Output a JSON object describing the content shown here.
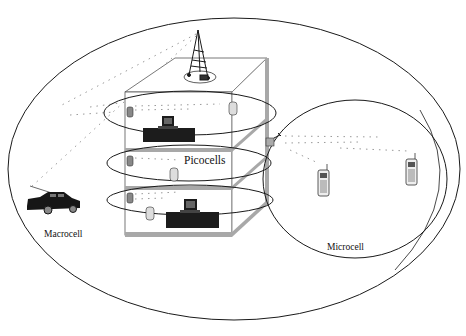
{
  "diagram": {
    "type": "cellular-network-hierarchy",
    "labels": {
      "picocells": "Picocells",
      "macrocell": "Macrocell",
      "microcell": "Microcell"
    },
    "regions": [
      {
        "name": "Macrocell",
        "shape": "ellipse",
        "contains": [
          "building",
          "car",
          "microcell"
        ]
      },
      {
        "name": "Microcell",
        "shape": "ellipse",
        "contains": [
          "mobile-phone",
          "mobile-phone"
        ]
      },
      {
        "name": "Picocells",
        "shape": "ellipse",
        "count": 3,
        "location": "building floors"
      }
    ],
    "elements": [
      {
        "name": "macrocell-tower",
        "icon": "antenna-tower-icon",
        "location": "building rooftop"
      },
      {
        "name": "microcell-base-station",
        "icon": "antenna-box-icon",
        "location": "building side"
      },
      {
        "name": "car",
        "icon": "car-icon",
        "location": "macrocell left"
      },
      {
        "name": "desktop-computers",
        "icon": "computer-icon",
        "count": 2
      },
      {
        "name": "handsets",
        "icon": "mobile-phone-icon",
        "count": 8
      }
    ],
    "colors": {
      "line": "#1a1a1a",
      "building_floor": "#a8a8a8",
      "signal_dots": "#9a9a9a",
      "device_dark": "#1c1c1c"
    }
  }
}
